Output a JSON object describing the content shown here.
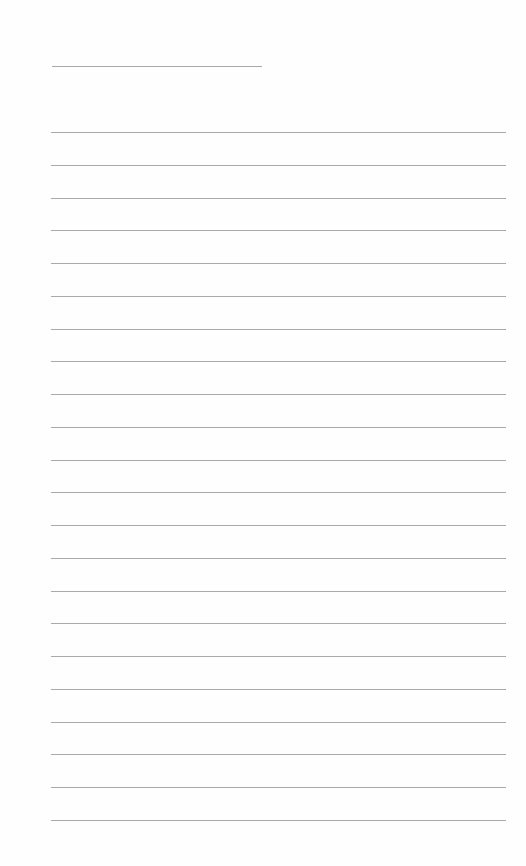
{
  "page": {
    "type": "lined-writing-paper",
    "background_color": "#fefefe",
    "line_color": "#a9a9a9",
    "title_line": {
      "x": 52,
      "y": 66,
      "width": 210
    },
    "rules": {
      "count": 22,
      "x": 51,
      "width": 455,
      "first_y": 132,
      "spacing": 32.76
    },
    "text": []
  }
}
